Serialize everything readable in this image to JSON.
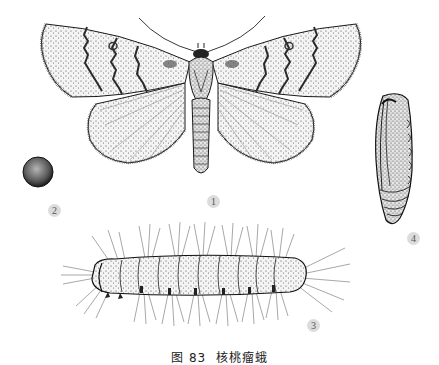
{
  "figure": {
    "caption": "图 83  核桃瘤蛾",
    "style": "monochrome stipple line illustration",
    "colors": {
      "ink": "#1a1a1a",
      "stipple": "#444444",
      "label_bg": "#dcdcdc",
      "label_text": "#555555",
      "background": "#ffffff"
    },
    "specimens": [
      {
        "id": "adult",
        "label": "1",
        "description": "adult moth, wings spread"
      },
      {
        "id": "egg",
        "label": "2",
        "description": "egg"
      },
      {
        "id": "larva",
        "label": "3",
        "description": "hairy larva, lateral view"
      },
      {
        "id": "pupa",
        "label": "4",
        "description": "pupa"
      }
    ]
  }
}
